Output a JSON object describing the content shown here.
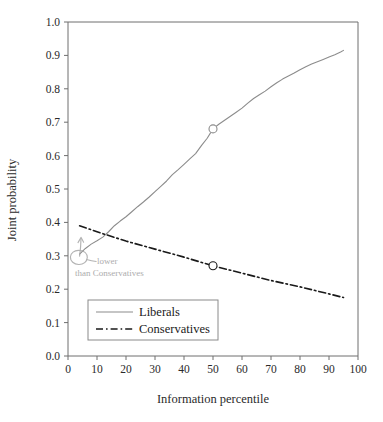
{
  "chart_data": {
    "type": "line",
    "title": "",
    "xlabel": "Information percentile",
    "ylabel": "Joint probability",
    "xlim": [
      0,
      100
    ],
    "ylim": [
      0.0,
      1.0
    ],
    "xticks": [
      0,
      10,
      20,
      30,
      40,
      50,
      60,
      70,
      80,
      90,
      100
    ],
    "xtick_labels": [
      "0",
      "10",
      "20",
      "30",
      "40",
      "50",
      "60",
      "70",
      "80",
      "90",
      "100"
    ],
    "yticks": [
      0.0,
      0.1,
      0.2,
      0.3,
      0.4,
      0.5,
      0.6,
      0.7,
      0.8,
      0.9,
      1.0
    ],
    "ytick_labels": [
      "0.0",
      "0.1",
      "0.2",
      "0.3",
      "0.4",
      "0.5",
      "0.6",
      "0.7",
      "0.8",
      "0.9",
      "1.0"
    ],
    "grid": false,
    "legend_position": "lower left",
    "series": [
      {
        "name": "Liberals",
        "style": "solid",
        "color": "#8c8c8c",
        "marker": "circle-open",
        "marker_points": [
          {
            "x": 50,
            "y": 0.68
          }
        ],
        "x": [
          4,
          6,
          8,
          10,
          12,
          14,
          16,
          18,
          20,
          22,
          24,
          26,
          28,
          30,
          32,
          34,
          36,
          38,
          40,
          42,
          44,
          46,
          48,
          50,
          52,
          54,
          56,
          58,
          60,
          62,
          64,
          66,
          68,
          70,
          72,
          74,
          76,
          78,
          80,
          82,
          84,
          86,
          88,
          90,
          92,
          94,
          95
        ],
        "y": [
          0.305,
          0.322,
          0.335,
          0.345,
          0.356,
          0.372,
          0.39,
          0.404,
          0.417,
          0.432,
          0.447,
          0.461,
          0.476,
          0.492,
          0.508,
          0.524,
          0.543,
          0.558,
          0.574,
          0.59,
          0.606,
          0.63,
          0.652,
          0.68,
          0.694,
          0.706,
          0.718,
          0.73,
          0.742,
          0.757,
          0.771,
          0.782,
          0.793,
          0.806,
          0.818,
          0.829,
          0.838,
          0.847,
          0.857,
          0.866,
          0.874,
          0.881,
          0.888,
          0.895,
          0.902,
          0.91,
          0.915
        ]
      },
      {
        "name": "Conservatives",
        "style": "dash-dot",
        "color": "#1a1a1a",
        "marker": "circle-open",
        "marker_points": [
          {
            "x": 50,
            "y": 0.27
          }
        ],
        "x": [
          4,
          10,
          20,
          30,
          40,
          50,
          60,
          70,
          80,
          90,
          95
        ],
        "y": [
          0.39,
          0.372,
          0.344,
          0.32,
          0.296,
          0.27,
          0.248,
          0.226,
          0.207,
          0.186,
          0.175
        ]
      }
    ],
    "annotations": [
      {
        "name": "handwritten-note",
        "text_line1": "lower",
        "text_line2": "than Conservatives",
        "style": "handwritten-pencil",
        "color": "#a0a0a0",
        "points_to": {
          "x": 5,
          "y": 0.31
        }
      }
    ]
  },
  "legend": {
    "items": [
      {
        "label": "Liberals"
      },
      {
        "label": "Conservatives"
      }
    ]
  }
}
